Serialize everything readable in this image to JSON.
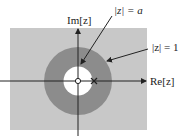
{
  "diagram": {
    "type": "z-plane region of convergence",
    "labels": {
      "imag_axis": "Im[z]",
      "real_axis": "Re[z]",
      "inner_circle": "|z| = a",
      "unit_circle": "|z| = 1"
    },
    "markers": {
      "zero": "circle at origin",
      "pole": "cross at z = a"
    },
    "colors": {
      "background_region": "#c8c8c8",
      "roc_annulus": "#8c8c8c",
      "inner_disk": "#ffffff",
      "lines": "#222222"
    }
  }
}
